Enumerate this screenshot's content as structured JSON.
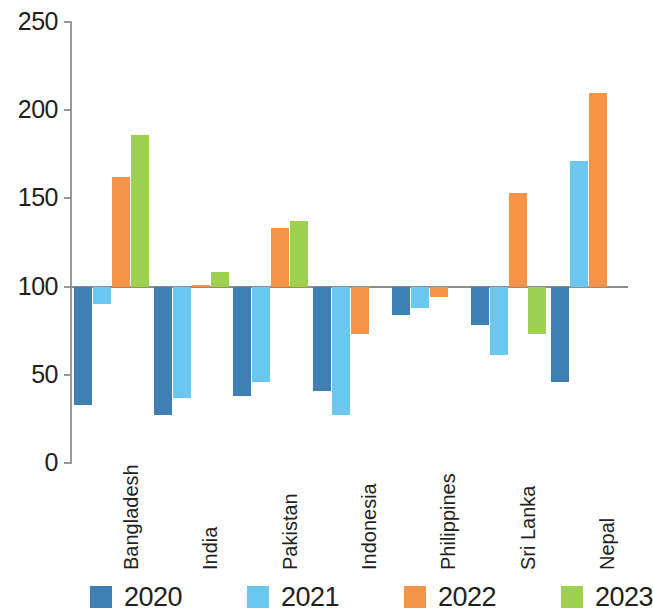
{
  "chart_data": {
    "type": "bar",
    "title": "",
    "subtitle": "",
    "xlabel": "",
    "ylabel": "",
    "ylim": [
      0,
      250
    ],
    "yticks": [
      0,
      50,
      100,
      150,
      200,
      250
    ],
    "ytick_labels": [
      "0",
      "50",
      "100",
      "150",
      "200",
      "250"
    ],
    "grid": false,
    "baseline": 100,
    "legend_position": "bottom",
    "categories": [
      "Bangladesh",
      "India",
      "Pakistan",
      "Indonesia",
      "Philippines",
      "Sri Lanka",
      "Nepal"
    ],
    "series": [
      {
        "name": "2020",
        "color": "#3e7fb4",
        "values": [
          33,
          27,
          38,
          41,
          84,
          78,
          46
        ]
      },
      {
        "name": "2021",
        "color": "#6cc7ef",
        "values": [
          90,
          37,
          46,
          27,
          88,
          61,
          171
        ]
      },
      {
        "name": "2022",
        "color": "#f2944a",
        "values": [
          162,
          101,
          133,
          73,
          94,
          153,
          210
        ]
      },
      {
        "name": "2023",
        "color": "#9ed14f",
        "values": [
          186,
          108,
          137,
          null,
          null,
          73,
          null
        ]
      }
    ]
  },
  "legend": {
    "items": [
      {
        "label": "2020",
        "color": "#3e7fb4"
      },
      {
        "label": "2021",
        "color": "#6cc7ef"
      },
      {
        "label": "2022",
        "color": "#f2944a"
      },
      {
        "label": "2023",
        "color": "#9ed14f"
      }
    ]
  },
  "axis": {
    "y_tick_labels": [
      "250",
      "200",
      "150",
      "100",
      "50",
      "0"
    ]
  }
}
